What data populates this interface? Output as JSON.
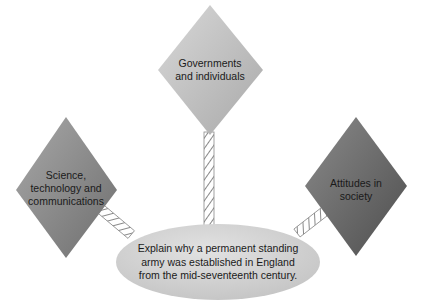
{
  "diagram": {
    "type": "spider-diagram",
    "central_question": {
      "lines": [
        "Explain why a permanent standing",
        "army was established in England",
        "from the mid-seventeenth century."
      ]
    },
    "factors": [
      {
        "id": "governments",
        "lines": [
          "Governments",
          "and individuals"
        ],
        "position": "top",
        "color": "#c9c9c9"
      },
      {
        "id": "science",
        "lines": [
          "Science,",
          "technology and",
          "communications"
        ],
        "position": "left",
        "color": "#8a8a8a"
      },
      {
        "id": "attitudes",
        "lines": [
          "Attitudes in",
          "society"
        ],
        "position": "right",
        "color": "#6a6a6a"
      }
    ],
    "connector_style": "rope"
  }
}
